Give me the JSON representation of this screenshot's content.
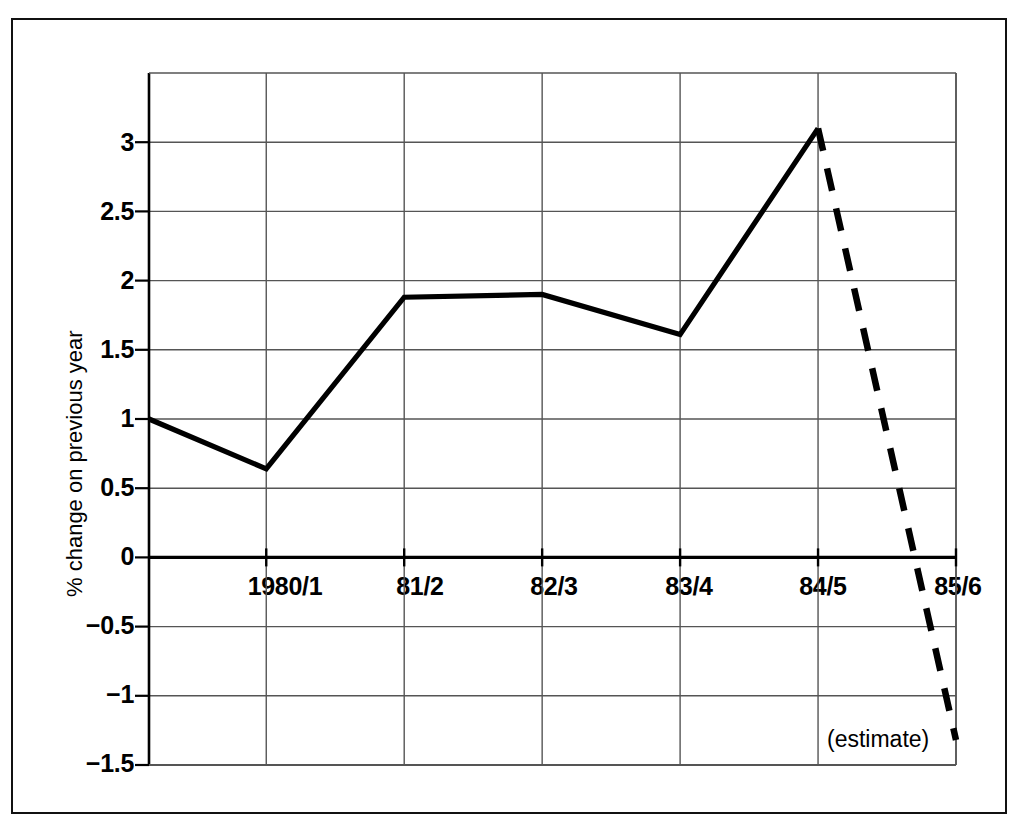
{
  "chart_data": {
    "type": "line",
    "title": "",
    "subtitle": "",
    "xlabel": "",
    "ylabel": "% change on previous year",
    "categories": [
      "1980/1",
      "81/2",
      "82/3",
      "83/4",
      "84/5",
      "85/6"
    ],
    "x_tick_labels": [
      "1980/1",
      "81/2",
      "82/3",
      "83/4",
      "84/5",
      "85/6"
    ],
    "y_tick_labels": [
      "3",
      "2.5",
      "2",
      "1.5",
      "1",
      "0.5",
      "0",
      "−0.5",
      "−1",
      "−1.5"
    ],
    "y_tick_values": [
      3,
      2.5,
      2,
      1.5,
      1,
      0.5,
      0,
      -0.5,
      -1,
      -1.5
    ],
    "ylim": [
      -1.5,
      3.5
    ],
    "xlim": [
      -0.85,
      5.0
    ],
    "grid": true,
    "legend": false,
    "zero_line_emphasis": true,
    "series": [
      {
        "name": "actual",
        "style": "solid",
        "x": [
          -0.85,
          0,
          1,
          2,
          3,
          4
        ],
        "x_labels": [
          "",
          "1980/1",
          "81/2",
          "82/3",
          "83/4",
          "84/5"
        ],
        "values": [
          1.0,
          0.64,
          1.88,
          1.9,
          1.61,
          3.1
        ]
      },
      {
        "name": "estimate",
        "style": "dashed",
        "x": [
          4,
          5
        ],
        "x_labels": [
          "84/5",
          "85/6"
        ],
        "values": [
          3.1,
          -1.32
        ]
      }
    ],
    "annotations": [
      {
        "text": "(estimate)",
        "x": 4.55,
        "y": -1.22
      }
    ],
    "colors": {
      "line": "#000000",
      "grid": "#555555",
      "axis": "#000000",
      "frame": "#111111",
      "background": "#ffffff"
    }
  },
  "axis": {
    "y_title": "% change on previous year",
    "ticks_y": [
      {
        "label": "3",
        "value": 3
      },
      {
        "label": "2.5",
        "value": 2.5
      },
      {
        "label": "2",
        "value": 2
      },
      {
        "label": "1.5",
        "value": 1.5
      },
      {
        "label": "1",
        "value": 1
      },
      {
        "label": "0.5",
        "value": 0.5
      },
      {
        "label": "0",
        "value": 0
      },
      {
        "label": "−0.5",
        "value": -0.5
      },
      {
        "label": "−1",
        "value": -1
      },
      {
        "label": "−1.5",
        "value": -1.5
      }
    ],
    "ticks_x": [
      {
        "label": "1980/1",
        "value": 0
      },
      {
        "label": "81/2",
        "value": 1
      },
      {
        "label": "82/3",
        "value": 2
      },
      {
        "label": "83/4",
        "value": 3
      },
      {
        "label": "84/5",
        "value": 4
      },
      {
        "label": "85/6",
        "value": 5
      }
    ]
  },
  "annotation": {
    "estimate_label": "(estimate)"
  }
}
